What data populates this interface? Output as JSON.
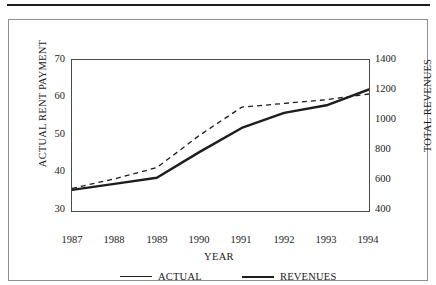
{
  "figure": {
    "frame_border_color": "#8f8f8f",
    "rule_color": "#1d1d1d",
    "background": "#ffffff"
  },
  "axes": {
    "x_title": "YEAR",
    "y_left_title": "ACTUAL RENT PAYMENT",
    "y_right_title": "TOTAL REVENUES",
    "x_ticks": [
      "1987",
      "1988",
      "1989",
      "1990",
      "1991",
      "1992",
      "1993",
      "1994"
    ],
    "y_left_ticks": [
      "30",
      "40",
      "50",
      "60",
      "70"
    ],
    "y_right_ticks": [
      "400",
      "600",
      "800",
      "1000",
      "1200",
      "1400"
    ]
  },
  "legend": {
    "items": [
      {
        "label": "ACTUAL",
        "style": "thin",
        "color": "#1d1d1d"
      },
      {
        "label": "REVENUES",
        "style": "thick",
        "color": "#1d1d1d"
      }
    ]
  },
  "chart_data": {
    "type": "line",
    "title": "",
    "xlabel": "YEAR",
    "ylabel": "ACTUAL RENT PAYMENT",
    "ylabel_secondary": "TOTAL REVENUES",
    "x": [
      1987,
      1988,
      1989,
      1990,
      1991,
      1992,
      1993,
      1994
    ],
    "categories": [
      "1987",
      "1988",
      "1989",
      "1990",
      "1991",
      "1992",
      "1993",
      "1994"
    ],
    "ylim": [
      30,
      70
    ],
    "ylim_secondary": [
      400,
      1400
    ],
    "xlim": [
      1987,
      1994
    ],
    "y_left_tick_values": [
      30,
      40,
      50,
      60,
      70
    ],
    "y_right_tick_values": [
      400,
      600,
      800,
      1000,
      1200,
      1400
    ],
    "grid": false,
    "legend_position": "below",
    "series": [
      {
        "name": "ACTUAL",
        "axis": "left",
        "linestyle": "dashed",
        "linewidth": 1.3,
        "color": "#1d1d1d",
        "values": [
          36.0,
          38.5,
          41.5,
          50.0,
          57.5,
          58.5,
          59.5,
          61.0
        ]
      },
      {
        "name": "REVENUES",
        "axis": "right",
        "linestyle": "solid",
        "linewidth": 2.4,
        "color": "#1d1d1d",
        "values": [
          540,
          580,
          620,
          790,
          950,
          1050,
          1100,
          1205
        ]
      }
    ]
  }
}
